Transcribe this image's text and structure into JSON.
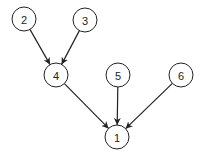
{
  "diagram": {
    "type": "directed-tree",
    "node_radius": 12,
    "stroke_color": "#222222",
    "background": "#ffffff",
    "nodes": [
      {
        "id": "1",
        "label": "1",
        "x": 117,
        "y": 137
      },
      {
        "id": "2",
        "label": "2",
        "x": 24,
        "y": 19
      },
      {
        "id": "3",
        "label": "3",
        "x": 85,
        "y": 20
      },
      {
        "id": "4",
        "label": "4",
        "x": 56,
        "y": 75
      },
      {
        "id": "5",
        "label": "5",
        "x": 118,
        "y": 75
      },
      {
        "id": "6",
        "label": "6",
        "x": 181,
        "y": 75
      }
    ],
    "edges": [
      {
        "from": "2",
        "to": "4"
      },
      {
        "from": "3",
        "to": "4"
      },
      {
        "from": "4",
        "to": "1"
      },
      {
        "from": "5",
        "to": "1"
      },
      {
        "from": "6",
        "to": "1"
      }
    ]
  }
}
